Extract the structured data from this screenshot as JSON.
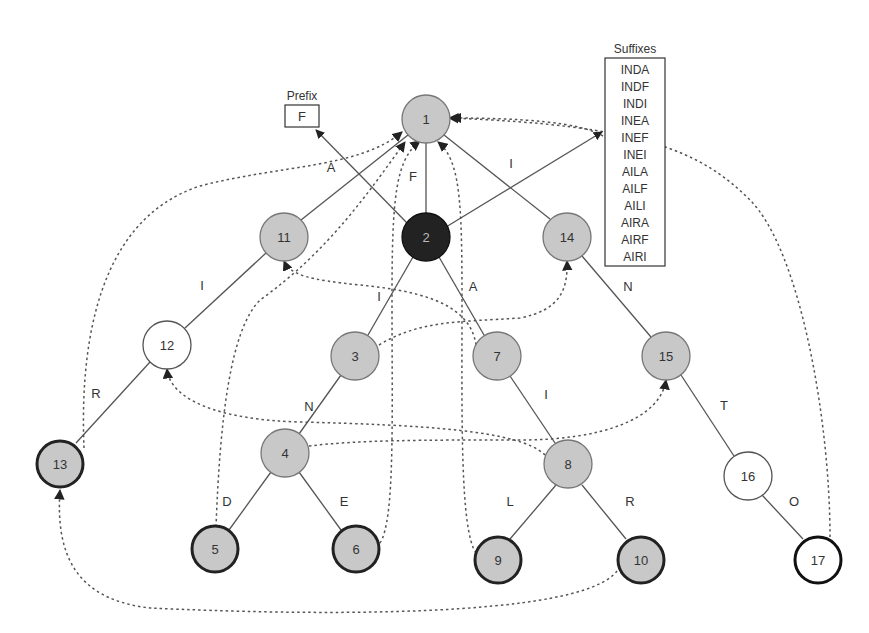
{
  "diagram": {
    "prefix": {
      "title": "Prefix",
      "value": "F"
    },
    "suffixes": {
      "title": "Suffixes",
      "items": [
        "INDA",
        "INDF",
        "INDI",
        "INEA",
        "INEF",
        "INEI",
        "AILA",
        "AILF",
        "AILI",
        "AIRA",
        "AIRF",
        "AIRI"
      ]
    },
    "nodes": [
      {
        "id": "1",
        "label": "1",
        "style": "gray"
      },
      {
        "id": "2",
        "label": "2",
        "style": "dark"
      },
      {
        "id": "3",
        "label": "3",
        "style": "gray"
      },
      {
        "id": "4",
        "label": "4",
        "style": "gray"
      },
      {
        "id": "5",
        "label": "5",
        "style": "gray-bold"
      },
      {
        "id": "6",
        "label": "6",
        "style": "gray-bold"
      },
      {
        "id": "7",
        "label": "7",
        "style": "gray"
      },
      {
        "id": "8",
        "label": "8",
        "style": "gray"
      },
      {
        "id": "9",
        "label": "9",
        "style": "gray-bold"
      },
      {
        "id": "10",
        "label": "10",
        "style": "gray-bold"
      },
      {
        "id": "11",
        "label": "11",
        "style": "gray"
      },
      {
        "id": "12",
        "label": "12",
        "style": "white"
      },
      {
        "id": "13",
        "label": "13",
        "style": "gray-bold"
      },
      {
        "id": "14",
        "label": "14",
        "style": "gray"
      },
      {
        "id": "15",
        "label": "15",
        "style": "gray"
      },
      {
        "id": "16",
        "label": "16",
        "style": "white"
      },
      {
        "id": "17",
        "label": "17",
        "style": "white-bold"
      }
    ],
    "edge_labels": {
      "e_2_1": "F",
      "e_1_11": "A",
      "e_11_12": "I",
      "e_12_13": "R",
      "e_2_3": "I",
      "e_3_4": "N",
      "e_4_5": "D",
      "e_4_6": "E",
      "e_2_7": "A",
      "e_7_8": "I",
      "e_8_9": "L",
      "e_8_10": "R",
      "e_1_14": "I",
      "e_14_15": "N",
      "e_15_16": "T",
      "e_16_17": "O"
    }
  }
}
